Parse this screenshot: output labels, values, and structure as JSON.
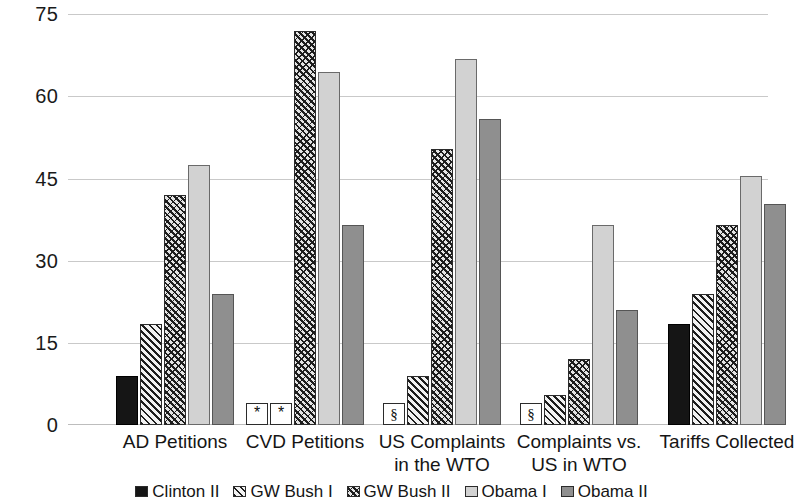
{
  "chart_data": {
    "type": "bar",
    "title": "",
    "subtitle": "",
    "xlabel": "",
    "ylabel": "",
    "ylim": [
      0,
      75
    ],
    "yticks": [
      0,
      15,
      30,
      45,
      60,
      75
    ],
    "grid": true,
    "legend_position": "bottom",
    "categories": [
      "AD Petitions",
      "CVD Petitions",
      "US Complaints in the WTO",
      "Complaints vs. US in WTO",
      "Tariffs Collected"
    ],
    "category_lines": [
      [
        "AD Petitions"
      ],
      [
        "CVD Petitions"
      ],
      [
        "US Complaints",
        "in the WTO"
      ],
      [
        "Complaints vs.",
        "US in WTO"
      ],
      [
        "Tariffs Collected"
      ]
    ],
    "series": [
      {
        "name": "Clinton II",
        "pattern": "solid-black",
        "color": "#151515",
        "values": [
          9,
          null,
          null,
          null,
          18.5
        ],
        "markers": [
          null,
          "*",
          "§",
          "§",
          null
        ]
      },
      {
        "name": "GW Bush I",
        "pattern": "diagonal-hatch",
        "color": "#1d1d1d",
        "values": [
          18.5,
          null,
          9,
          5.5,
          24
        ],
        "markers": [
          null,
          "*",
          null,
          null,
          null
        ]
      },
      {
        "name": "GW Bush II",
        "pattern": "cross-hatch",
        "color": "#1d1d1d",
        "values": [
          42,
          72,
          50.5,
          12,
          36.5
        ],
        "markers": [
          null,
          null,
          null,
          null,
          null
        ]
      },
      {
        "name": "Obama I",
        "pattern": "light-gray",
        "color": "#d2d2d2",
        "values": [
          47.5,
          64.5,
          67,
          36.5,
          45.5
        ],
        "markers": [
          null,
          null,
          null,
          null,
          null
        ]
      },
      {
        "name": "Obama II",
        "pattern": "medium-gray",
        "color": "#8f8f8f",
        "values": [
          24,
          36.5,
          56,
          21,
          40.5
        ],
        "markers": [
          null,
          null,
          null,
          null,
          null
        ]
      }
    ],
    "footnote_symbols": {
      "asterisk": "*",
      "section": "§"
    }
  }
}
